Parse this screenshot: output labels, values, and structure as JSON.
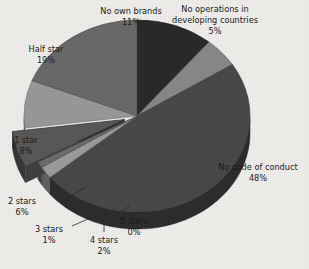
{
  "background_color": "#f2f1ee",
  "chart_data": {
    "type": "pie",
    "title": "",
    "subtitle": "",
    "xlabel": "",
    "ylabel": "",
    "legend_position": "none",
    "grid": false,
    "three_d": true,
    "units": "percent",
    "total": 100,
    "categories": [
      "No own brands",
      "No operations in developing countries",
      "No code of conduct",
      "5 stars",
      "4 stars",
      "3 stars",
      "2 stars",
      "1 star",
      "Half star"
    ],
    "values": [
      11,
      5,
      48,
      0,
      2,
      1,
      6,
      8,
      19
    ],
    "slices": [
      {
        "label": "No own brands",
        "value": 11,
        "value_text": "11%",
        "color": "#2b2b2b",
        "exploded": false,
        "label_pos": "top-left",
        "leader_line": false
      },
      {
        "label": "No operations in developing countries",
        "value": 5,
        "value_text": "5%",
        "color": "#8a8a8a",
        "exploded": false,
        "label_pos": "top-right",
        "leader_line": false
      },
      {
        "label": "No code of conduct",
        "value": 48,
        "value_text": "48%",
        "color": "#4a4a4a",
        "exploded": false,
        "label_pos": "right",
        "leader_line": false
      },
      {
        "label": "5 stars",
        "value": 0,
        "value_text": "0%",
        "color": "#d4d4d4",
        "exploded": false,
        "label_pos": "bottom",
        "leader_line": true
      },
      {
        "label": "4 stars",
        "value": 2,
        "value_text": "2%",
        "color": "#9e9e9e",
        "exploded": false,
        "label_pos": "bottom",
        "leader_line": true
      },
      {
        "label": "3 stars",
        "value": 1,
        "value_text": "1%",
        "color": "#6f6f6f",
        "exploded": false,
        "label_pos": "bottom-left",
        "leader_line": true
      },
      {
        "label": "2 stars",
        "value": 6,
        "value_text": "6%",
        "color": "#5a5a5a",
        "exploded": true,
        "label_pos": "left-bottom",
        "leader_line": true
      },
      {
        "label": "1 star",
        "value": 8,
        "value_text": "8%",
        "color": "#9b9b9b",
        "exploded": false,
        "label_pos": "left",
        "leader_line": false
      },
      {
        "label": "Half star",
        "value": 19,
        "value_text": "19%",
        "color": "#6b6b6b",
        "exploded": false,
        "label_pos": "top-left-upper",
        "leader_line": false
      }
    ]
  },
  "labels": {
    "no_own_brands": {
      "name": "No own brands",
      "pct": "11%"
    },
    "no_operations": {
      "line1": "No operations in",
      "line2": "developing countries",
      "pct": "5%"
    },
    "no_code": {
      "name": "No code of conduct",
      "pct": "48%"
    },
    "half_star": {
      "name": "Half star",
      "pct": "19%"
    },
    "one_star": {
      "name": "1 star",
      "pct": "8%"
    },
    "two_stars": {
      "name": "2 stars",
      "pct": "6%"
    },
    "three_stars": {
      "name": "3 stars",
      "pct": "1%"
    },
    "four_stars": {
      "name": "4 stars",
      "pct": "2%"
    },
    "five_stars": {
      "name": "5 stars",
      "pct": "0%"
    }
  }
}
